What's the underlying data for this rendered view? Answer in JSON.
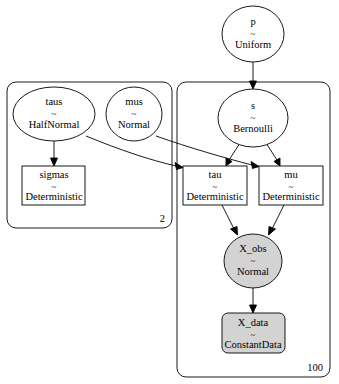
{
  "diagram": {
    "type": "probabilistic-graphical-model",
    "colors": {
      "background": "#ffffff",
      "stroke": "#000000",
      "observed_fill": "#d3d3d3",
      "free_fill": "#ffffff"
    },
    "plates": [
      {
        "id": "plate-2",
        "label": "2",
        "contains": [
          "taus",
          "mus",
          "sigmas"
        ]
      },
      {
        "id": "plate-100",
        "label": "100",
        "contains": [
          "s",
          "tau",
          "mu",
          "X_obs",
          "X_data"
        ]
      }
    ],
    "nodes": {
      "p": {
        "name": "p",
        "sep": "~",
        "dist": "Uniform",
        "shape": "ellipse",
        "observed": false
      },
      "taus": {
        "name": "taus",
        "sep": "~",
        "dist": "HalfNormal",
        "shape": "ellipse",
        "observed": false
      },
      "mus": {
        "name": "mus",
        "sep": "~",
        "dist": "Normal",
        "shape": "ellipse",
        "observed": false
      },
      "sigmas": {
        "name": "sigmas",
        "sep": "~",
        "dist": "Deterministic",
        "shape": "box",
        "observed": false
      },
      "s": {
        "name": "s",
        "sep": "~",
        "dist": "Bernoulli",
        "shape": "ellipse",
        "observed": false
      },
      "tau": {
        "name": "tau",
        "sep": "~",
        "dist": "Deterministic",
        "shape": "box",
        "observed": false
      },
      "mu": {
        "name": "mu",
        "sep": "~",
        "dist": "Deterministic",
        "shape": "box",
        "observed": false
      },
      "X_obs": {
        "name": "X_obs",
        "sep": "~",
        "dist": "Normal",
        "shape": "ellipse",
        "observed": true
      },
      "X_data": {
        "name": "X_data",
        "sep": "~",
        "dist": "ConstantData",
        "shape": "roundbox",
        "observed": true
      }
    },
    "edges": [
      {
        "from": "p",
        "to": "s"
      },
      {
        "from": "taus",
        "to": "sigmas"
      },
      {
        "from": "taus",
        "to": "tau"
      },
      {
        "from": "mus",
        "to": "mu"
      },
      {
        "from": "s",
        "to": "tau"
      },
      {
        "from": "s",
        "to": "mu"
      },
      {
        "from": "tau",
        "to": "X_obs"
      },
      {
        "from": "mu",
        "to": "X_obs"
      },
      {
        "from": "X_obs",
        "to": "X_data"
      }
    ]
  }
}
